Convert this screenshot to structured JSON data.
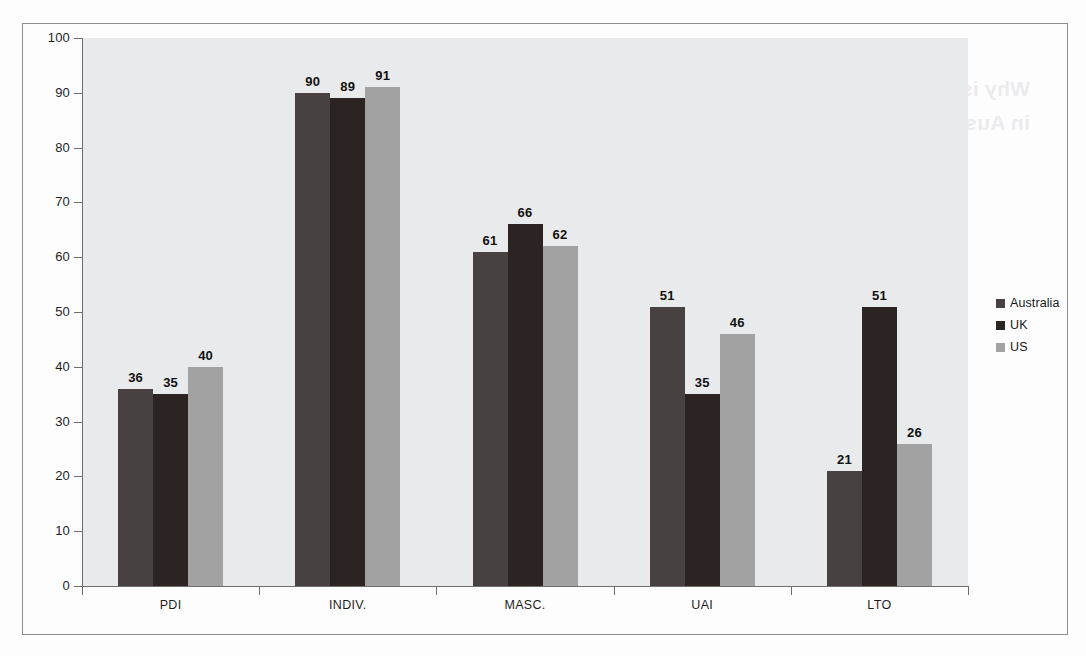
{
  "chart_data": {
    "type": "bar",
    "title": "",
    "xlabel": "",
    "ylabel": "",
    "categories": [
      "PDI",
      "INDIV.",
      "MASC.",
      "UAI",
      "LTO"
    ],
    "series": [
      {
        "name": "Australia",
        "color": "#474241",
        "values": [
          36,
          90,
          61,
          51,
          21
        ]
      },
      {
        "name": "UK",
        "color": "#2b2422",
        "values": [
          35,
          89,
          66,
          35,
          51
        ]
      },
      {
        "name": "US",
        "color": "#a2a2a2",
        "values": [
          40,
          91,
          62,
          46,
          26
        ]
      }
    ],
    "ylim": [
      0,
      100
    ],
    "yticks": [
      0,
      10,
      20,
      30,
      40,
      50,
      60,
      70,
      80,
      90,
      100
    ],
    "grid": false,
    "legend_position": "right",
    "data_labels": true,
    "plot_background": "#e9eaec"
  },
  "legend": {
    "items": [
      {
        "label": "Australia",
        "color": "#474241"
      },
      {
        "label": "UK",
        "color": "#2b2422"
      },
      {
        "label": "US",
        "color": "#a2a2a2"
      }
    ]
  },
  "bleed_through_text": "Why is seeing your work is own expectations in Australia?"
}
